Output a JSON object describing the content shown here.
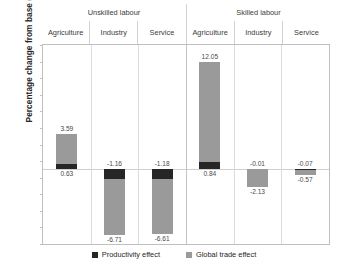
{
  "chart_data": {
    "type": "bar",
    "title": "",
    "xlabel": "",
    "ylabel": "Percentage change from base (%)",
    "ylim": [
      -9,
      15
    ],
    "yticks": [
      15,
      13,
      11,
      9,
      7,
      5,
      3,
      1,
      -1,
      -3,
      -5,
      -7,
      -9
    ],
    "grid": false,
    "stacked": true,
    "legend_position": "bottom",
    "groups": [
      {
        "label": "Unskilled labour",
        "categories": [
          "Agriculture",
          "Industry",
          "Service"
        ]
      },
      {
        "label": "Skilled labour",
        "categories": [
          "Agriculture",
          "Industry",
          "Service"
        ]
      }
    ],
    "categories": [
      "Unskilled labour / Agriculture",
      "Unskilled labour / Industry",
      "Unskilled labour / Service",
      "Skilled labour / Agriculture",
      "Skilled labour / Industry",
      "Skilled labour / Service"
    ],
    "series": [
      {
        "name": "Productivity effect",
        "color": "#262626",
        "values": [
          0.63,
          -1.16,
          -1.18,
          0.84,
          -0.01,
          -0.07
        ]
      },
      {
        "name": "Global trade effect",
        "color": "#9a9a9a",
        "values": [
          3.59,
          -6.71,
          -6.61,
          12.05,
          -2.13,
          -0.57
        ]
      }
    ],
    "point_labels": {
      "productivity": [
        "0.63",
        "-1.16",
        "-1.18",
        "0.84",
        "-0.01",
        "-0.07"
      ],
      "global_trade": [
        "3.59",
        "-6.71",
        "-6.61",
        "12.05",
        "-2.13",
        "-0.57"
      ]
    }
  },
  "axis": {
    "y_title": "Percentage change from base (%)",
    "tick_labels": [
      "15",
      "13",
      "11",
      "9",
      "7",
      "5",
      "3",
      "1",
      "-1",
      "-3",
      "-5",
      "-7",
      "-9"
    ]
  },
  "header": {
    "groups": [
      {
        "label": "Unskilled labour"
      },
      {
        "label": "Skilled labour"
      }
    ],
    "categories": [
      {
        "label": "Agriculture"
      },
      {
        "label": "Industry"
      },
      {
        "label": "Service"
      },
      {
        "label": "Agriculture"
      },
      {
        "label": "Industry"
      },
      {
        "label": "Service"
      }
    ]
  },
  "legend": {
    "items": [
      {
        "label": "Productivity effect",
        "color": "#262626"
      },
      {
        "label": "Global trade effect",
        "color": "#9a9a9a"
      }
    ]
  }
}
